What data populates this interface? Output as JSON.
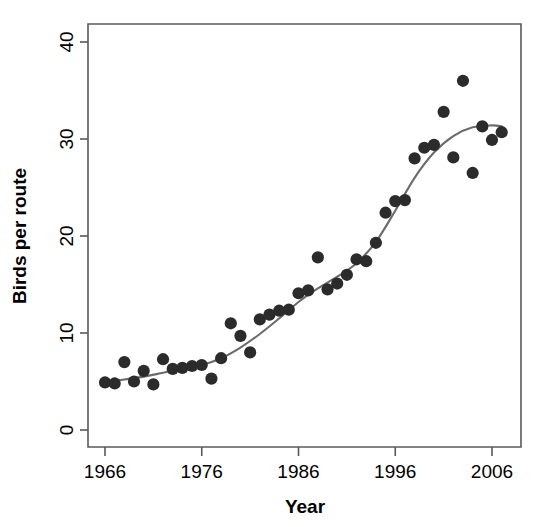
{
  "chart_data": {
    "type": "scatter",
    "title": "",
    "xlabel": "Year",
    "ylabel": "Birds per route",
    "xlim": [
      1965,
      2008
    ],
    "ylim": [
      0,
      41.5
    ],
    "grid": false,
    "legend": "none",
    "x_ticks": [
      1966,
      1976,
      1986,
      1996,
      2006
    ],
    "x_tick_labels": [
      "1966",
      "1976",
      "1986",
      "1996",
      "2006"
    ],
    "y_ticks": [
      0,
      10,
      20,
      30,
      40
    ],
    "y_tick_labels": [
      "0",
      "10",
      "20",
      "30",
      "40"
    ],
    "point_color": "#2b2b2b",
    "curve_color": "#6b6b6b",
    "series": [
      {
        "name": "Birds per route",
        "marker": "filled-circle",
        "x": [
          1966,
          1967,
          1968,
          1969,
          1970,
          1971,
          1972,
          1973,
          1974,
          1975,
          1976,
          1977,
          1978,
          1979,
          1980,
          1981,
          1982,
          1983,
          1984,
          1985,
          1986,
          1987,
          1988,
          1989,
          1990,
          1991,
          1992,
          1993,
          1994,
          1995,
          1996,
          1997,
          1998,
          1999,
          2000,
          2001,
          2002,
          2003,
          2004,
          2005,
          2006,
          2007
        ],
        "y": [
          4.9,
          4.8,
          7.0,
          5.0,
          6.1,
          4.7,
          7.3,
          6.3,
          6.4,
          6.6,
          6.7,
          5.3,
          7.4,
          11.0,
          9.7,
          8.0,
          11.4,
          11.9,
          12.3,
          12.4,
          14.1,
          14.4,
          17.8,
          14.5,
          15.1,
          16.0,
          17.6,
          17.4,
          19.3,
          22.4,
          23.6,
          23.7,
          28.0,
          29.1,
          29.4,
          32.8,
          28.1,
          36.0,
          26.5,
          31.3,
          29.9,
          30.7
        ]
      }
    ],
    "trend_line": {
      "name": "smoothed-fit",
      "x": [
        1966,
        1968,
        1970,
        1972,
        1974,
        1976,
        1978,
        1980,
        1982,
        1984,
        1986,
        1988,
        1990,
        1992,
        1994,
        1996,
        1998,
        2000,
        2002,
        2004,
        2006,
        2007
      ],
      "y": [
        4.9,
        5.2,
        5.5,
        5.9,
        6.3,
        6.7,
        7.4,
        8.5,
        9.9,
        11.5,
        13.2,
        14.6,
        15.8,
        17.2,
        19.4,
        22.6,
        26.0,
        28.6,
        30.3,
        31.2,
        31.4,
        31.3
      ]
    }
  },
  "axis": {
    "x_title": "Year",
    "y_title": "Birds per route"
  }
}
